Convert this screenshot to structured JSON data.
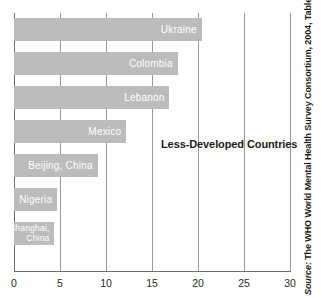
{
  "chart_data": {
    "type": "bar",
    "orientation": "horizontal",
    "title": "",
    "subtitle": "",
    "xlabel": "",
    "ylabel": "",
    "xlim": [
      0,
      30
    ],
    "xticks": [
      0,
      5,
      10,
      15,
      20,
      25,
      30
    ],
    "xtick_labels": [
      "0",
      "5",
      "10",
      "15",
      "20",
      "25",
      "30"
    ],
    "grid": true,
    "legend": "none",
    "annotations": [
      {
        "text": "Less-Developed Countries",
        "x": 16,
        "y_category": "Mexico"
      }
    ],
    "source_note": "Source: The WHO World Mental Health Survey Consortium, 2004, Table 3.",
    "bar_color": "#bcbcbc",
    "label_color": "#ffffff",
    "categories": [
      "Ukraine",
      "Colombia",
      "Lebanon",
      "Mexico",
      "Beijing, China",
      "Nigeria",
      "Shanghai, China"
    ],
    "values": [
      20.4,
      17.8,
      16.9,
      12.2,
      9.1,
      4.7,
      4.3
    ],
    "points": [
      {
        "label": "Ukraine",
        "value": 20.4,
        "label_lines": [
          "Ukraine"
        ]
      },
      {
        "label": "Colombia",
        "value": 17.8,
        "label_lines": [
          "Colombia"
        ]
      },
      {
        "label": "Lebanon",
        "value": 16.9,
        "label_lines": [
          "Lebanon"
        ]
      },
      {
        "label": "Mexico",
        "value": 12.2,
        "label_lines": [
          "Mexico"
        ]
      },
      {
        "label": "Beijing, China",
        "value": 9.1,
        "label_lines": [
          "Beijing, China"
        ]
      },
      {
        "label": "Nigeria",
        "value": 4.7,
        "label_lines": [
          "Nigeria"
        ]
      },
      {
        "label": "Shanghai, China",
        "value": 4.3,
        "label_lines": [
          "Shanghai,",
          "China"
        ]
      }
    ]
  },
  "source": {
    "prefix": "Source:",
    "body": " The WHO World Mental Health Survey Consortium, 2004, Table 3."
  }
}
